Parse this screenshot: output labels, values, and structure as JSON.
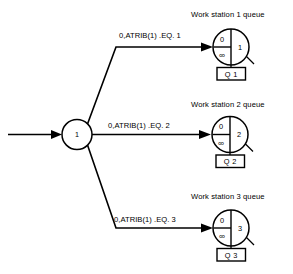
{
  "diagram": {
    "type": "slam-network-queue-diagram",
    "entry_arrow": {
      "label": ""
    },
    "center_node": {
      "label": "1",
      "shape": "circle"
    },
    "branches": [
      {
        "label": "0,ATRIB(1) .EQ. 1",
        "target": "queue-1"
      },
      {
        "label": "0,ATRIB(1) .EQ. 2",
        "target": "queue-2"
      },
      {
        "label": "0,ATRIB(1) .EQ. 3",
        "target": "queue-3"
      }
    ],
    "stations": [
      {
        "title": "Work station 1 queue",
        "initial_length": "0",
        "capacity": "∞",
        "queue_number": "1",
        "box_label": "Q 1"
      },
      {
        "title": "Work station 2 queue",
        "initial_length": "0",
        "capacity": "∞",
        "queue_number": "2",
        "box_label": "Q 2"
      },
      {
        "title": "Work station 3 queue",
        "initial_length": "0",
        "capacity": "∞",
        "queue_number": "3",
        "box_label": "Q 3"
      }
    ],
    "colors": {
      "ink": "#000000",
      "paper": "#ffffff"
    }
  }
}
